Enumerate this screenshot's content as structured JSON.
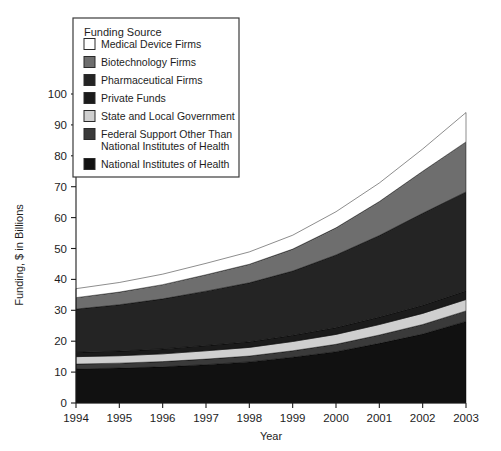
{
  "chart_data": {
    "type": "area",
    "title": "",
    "xlabel": "Year",
    "ylabel": "Funding, $ in Billions",
    "categories": [
      "1994",
      "1995",
      "1996",
      "1997",
      "1998",
      "1999",
      "2000",
      "2001",
      "2002",
      "2003"
    ],
    "x": [
      1994,
      1995,
      1996,
      1997,
      1998,
      1999,
      2000,
      2001,
      2002,
      2003
    ],
    "xlim": [
      1994,
      2003
    ],
    "ylim": [
      0,
      100
    ],
    "yticks": [
      0,
      10,
      20,
      30,
      40,
      50,
      60,
      70,
      80,
      90,
      100
    ],
    "xticks": [
      "1994",
      "1995",
      "1996",
      "1997",
      "1998",
      "1999",
      "2000",
      "2001",
      "2002",
      "2003"
    ],
    "grid": false,
    "stacked": true,
    "stack_order_bottom_to_top": [
      "National Institutes of Health",
      "Federal Support Other Than National Institutes of Health",
      "State and Local Government",
      "Private Funds",
      "Pharmaceutical Firms",
      "Biotechnology Firms",
      "Medical Device Firms"
    ],
    "legend_position": "upper-left-inset",
    "legend_title": "Funding Source",
    "series": [
      {
        "name": "National Institutes of Health",
        "color": "#111111",
        "values": [
          11.0,
          11.3,
          11.7,
          12.4,
          13.3,
          14.8,
          16.6,
          19.3,
          22.3,
          26.4
        ]
      },
      {
        "name": "Federal Support Other Than National Institutes of Health",
        "color": "#3a3a3a",
        "values": [
          1.6,
          1.6,
          1.7,
          1.8,
          1.9,
          2.1,
          2.4,
          2.7,
          3.1,
          3.4
        ]
      },
      {
        "name": "State and Local Government",
        "color": "#cfcfcf",
        "values": [
          2.4,
          2.4,
          2.5,
          2.7,
          2.8,
          3.0,
          3.2,
          3.4,
          3.6,
          3.7
        ]
      },
      {
        "name": "Private Funds",
        "color": "#1b1b1b",
        "values": [
          1.4,
          1.5,
          1.6,
          1.7,
          1.8,
          2.0,
          2.2,
          2.4,
          2.6,
          2.8
        ]
      },
      {
        "name": "Pharmaceutical Firms",
        "color": "#242424",
        "values": [
          14.0,
          15.0,
          16.2,
          17.6,
          19.1,
          20.8,
          23.5,
          26.4,
          29.8,
          32.0
        ]
      },
      {
        "name": "Biotechnology Firms",
        "color": "#6e6e6e",
        "values": [
          3.7,
          4.1,
          4.6,
          5.3,
          6.0,
          7.1,
          8.8,
          11.0,
          13.6,
          16.2
        ]
      },
      {
        "name": "Medical Device Firms",
        "color": "#ffffff",
        "values": [
          2.9,
          3.1,
          3.4,
          3.7,
          4.0,
          4.5,
          5.2,
          6.0,
          7.2,
          9.5
        ]
      }
    ],
    "totals": [
      37.0,
      39.0,
      41.7,
      45.2,
      48.9,
      54.3,
      61.9,
      71.2,
      82.2,
      94.0
    ]
  },
  "axes": {
    "y_title": "Funding, $ in Billions",
    "x_title": "Year",
    "y_tick_labels": [
      "100",
      "90",
      "80",
      "70",
      "60",
      "50",
      "40",
      "30",
      "20",
      "10",
      "0"
    ],
    "x_tick_labels": [
      "1994",
      "1995",
      "1996",
      "1997",
      "1998",
      "1999",
      "2000",
      "2001",
      "2002",
      "2003"
    ]
  },
  "legend": {
    "title": "Funding Source",
    "items": [
      {
        "label": "Medical Device Firms",
        "color": "#ffffff",
        "swatch": "swatch-medical-device"
      },
      {
        "label": "Biotechnology Firms",
        "color": "#6e6e6e",
        "swatch": "swatch-biotechnology"
      },
      {
        "label": "Pharmaceutical Firms",
        "color": "#242424",
        "swatch": "swatch-pharmaceutical"
      },
      {
        "label": "Private Funds",
        "color": "#1b1b1b",
        "swatch": "swatch-private-funds"
      },
      {
        "label": "State and Local Government",
        "color": "#cfcfcf",
        "swatch": "swatch-state-local"
      },
      {
        "label": "Federal Support Other Than",
        "label2": "National Institutes of Health",
        "color": "#3a3a3a",
        "swatch": "swatch-federal-other"
      },
      {
        "label": "National Institutes of Health",
        "color": "#111111",
        "swatch": "swatch-nih"
      }
    ]
  },
  "colors": {
    "axis": "#1d1d1d",
    "background": "#ffffff",
    "legend_border": "#3b3b3b"
  }
}
